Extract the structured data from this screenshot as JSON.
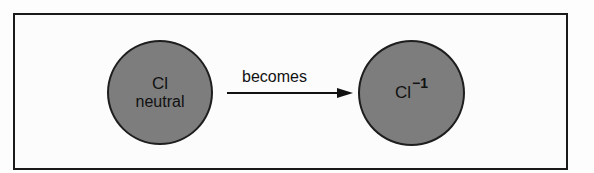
{
  "diagram": {
    "left_atom": {
      "symbol": "Cl",
      "label": "neutral"
    },
    "arrow": {
      "label": "becomes"
    },
    "right_atom": {
      "symbol": "Cl",
      "charge": "−1"
    },
    "colors": {
      "atom_fill": "#7d7d7d",
      "outline": "#1a1a1a",
      "background": "#fcfcfc"
    }
  }
}
